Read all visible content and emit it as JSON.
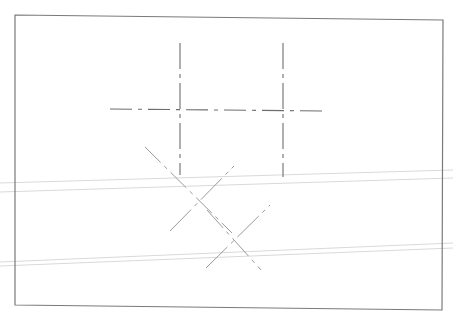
{
  "drawing": {
    "kind": "technical-drawing-centerlines",
    "colors": {
      "background": "#ffffff",
      "border": "#7a7a7a",
      "centerline": "#6e6e6e",
      "diagonal": "#9a9a9a",
      "scan_artifact": "#d9d9d9"
    },
    "border": {
      "points": "15,15 443,20 442,310 15,305"
    },
    "centerlines": [
      {
        "id": "vertical-1",
        "x1": 180,
        "y1": 43,
        "x2": 180,
        "y2": 175,
        "dash": "26,5,4,5"
      },
      {
        "id": "vertical-2",
        "x1": 283,
        "y1": 43,
        "x2": 283,
        "y2": 177,
        "dash": "26,5,4,5"
      },
      {
        "id": "horizontal",
        "x1": 110,
        "y1": 109,
        "x2": 328,
        "y2": 111,
        "dash": "22,6,4,6"
      }
    ],
    "diagonals": [
      {
        "id": "x1-a",
        "x1": 145,
        "y1": 147,
        "x2": 232,
        "y2": 233,
        "dash": "22,5,4,5"
      },
      {
        "id": "x1-b",
        "x1": 170,
        "y1": 231,
        "x2": 234,
        "y2": 166,
        "dash": "30,5,4,5"
      },
      {
        "id": "x2-a",
        "x1": 207,
        "y1": 210,
        "x2": 261,
        "y2": 270,
        "dash": "24,5,4,5"
      },
      {
        "id": "x2-b",
        "x1": 206,
        "y1": 268,
        "x2": 270,
        "y2": 205,
        "dash": "30,5,4,5"
      }
    ],
    "scan_lines": [
      {
        "x1": 0,
        "y1": 262,
        "x2": 453,
        "y2": 243
      },
      {
        "x1": 0,
        "y1": 266,
        "x2": 453,
        "y2": 248
      },
      {
        "x1": 0,
        "y1": 192,
        "x2": 453,
        "y2": 178
      },
      {
        "x1": 0,
        "y1": 183,
        "x2": 453,
        "y2": 170
      }
    ]
  }
}
